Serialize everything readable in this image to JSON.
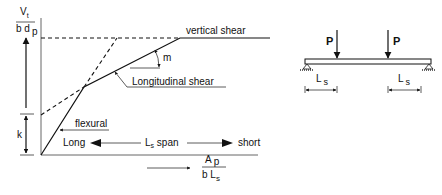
{
  "diagram": {
    "y_axis": {
      "numerator": "V",
      "numerator_sub": "t",
      "denominator": "b d",
      "denominator_sub": "p"
    },
    "k_label": "k",
    "curve_labels": {
      "vertical_shear": "vertical shear",
      "longitudinal_shear": "Longitudinal shear",
      "flexural": "flexural",
      "slope": "m"
    },
    "span_arrow": {
      "left": "Long",
      "middle_main": "L",
      "middle_sub": "s",
      "middle_rest": " span",
      "right": "short"
    },
    "x_axis": {
      "numerator": "A",
      "numerator_sub": "p",
      "denominator": "b L",
      "denominator_sub": "s"
    },
    "beam": {
      "loads": [
        "P",
        "P"
      ],
      "shear_span_main": "L",
      "shear_span_sub": "s"
    }
  }
}
